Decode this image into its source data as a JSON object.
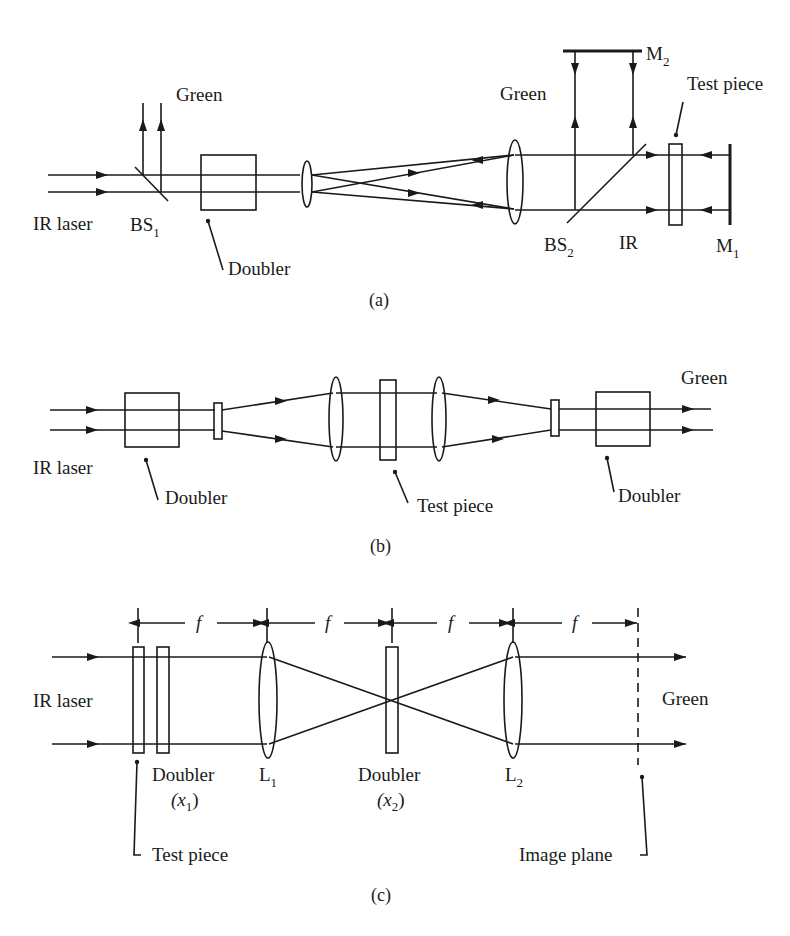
{
  "figure": {
    "panels": [
      {
        "id": "a",
        "caption": "(a)",
        "labels": {
          "ir_laser": "IR laser",
          "bs1": "BS",
          "bs1_sub": "1",
          "green_left": "Green",
          "doubler": "Doubler",
          "green_right": "Green",
          "m2": "M",
          "m2_sub": "2",
          "test_piece": "Test piece",
          "bs2": "BS",
          "bs2_sub": "2",
          "ir": "IR",
          "m1": "M",
          "m1_sub": "1"
        }
      },
      {
        "id": "b",
        "caption": "(b)",
        "labels": {
          "ir_laser": "IR laser",
          "doubler_left": "Doubler",
          "test_piece": "Test piece",
          "doubler_right": "Doubler",
          "green": "Green"
        }
      },
      {
        "id": "c",
        "caption": "(c)",
        "labels": {
          "f1": "f",
          "f2": "f",
          "f3": "f",
          "f4": "f",
          "ir_laser": "IR laser",
          "doubler_x1": "Doubler",
          "x1": "(x",
          "x1_sub": "1",
          "x1_close": ")",
          "l1": "L",
          "l1_sub": "1",
          "doubler_x2": "Doubler",
          "x2": "(x",
          "x2_sub": "2",
          "x2_close": ")",
          "l2": "L",
          "l2_sub": "2",
          "green": "Green",
          "test_piece": "Test piece",
          "image_plane": "Image plane"
        }
      }
    ]
  }
}
